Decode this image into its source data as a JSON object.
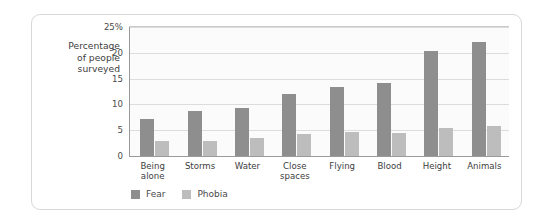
{
  "figure": {
    "y_caption": "Percentage\nof people\nsurveyed",
    "legend": [
      {
        "label": "Fear",
        "swatch": "dark-gray-swatch",
        "color": "#8e8e8e"
      },
      {
        "label": "Phobia",
        "swatch": "light-gray-swatch",
        "color": "#bdbdbd"
      }
    ]
  },
  "chart_data": {
    "type": "bar",
    "title": "",
    "subtitle": "",
    "xlabel": "",
    "ylabel": "Percentage of people surveyed",
    "ylim": [
      0,
      25
    ],
    "yticks": [
      0,
      5,
      10,
      15,
      20,
      25
    ],
    "ytick_labels": [
      "0",
      "5",
      "10",
      "15",
      "20",
      "25%"
    ],
    "grid": true,
    "legend_position": "bottom-left",
    "categories": [
      "Being alone",
      "Storms",
      "Water",
      "Close spaces",
      "Flying",
      "Blood",
      "Height",
      "Animals"
    ],
    "series": [
      {
        "name": "Fear",
        "color": "#8e8e8e",
        "values": [
          7.2,
          8.8,
          9.4,
          12.0,
          13.3,
          14.2,
          20.4,
          22.1
        ]
      },
      {
        "name": "Phobia",
        "color": "#bdbdbd",
        "values": [
          3.0,
          2.9,
          3.4,
          4.2,
          4.7,
          4.5,
          5.4,
          5.8
        ]
      }
    ]
  }
}
